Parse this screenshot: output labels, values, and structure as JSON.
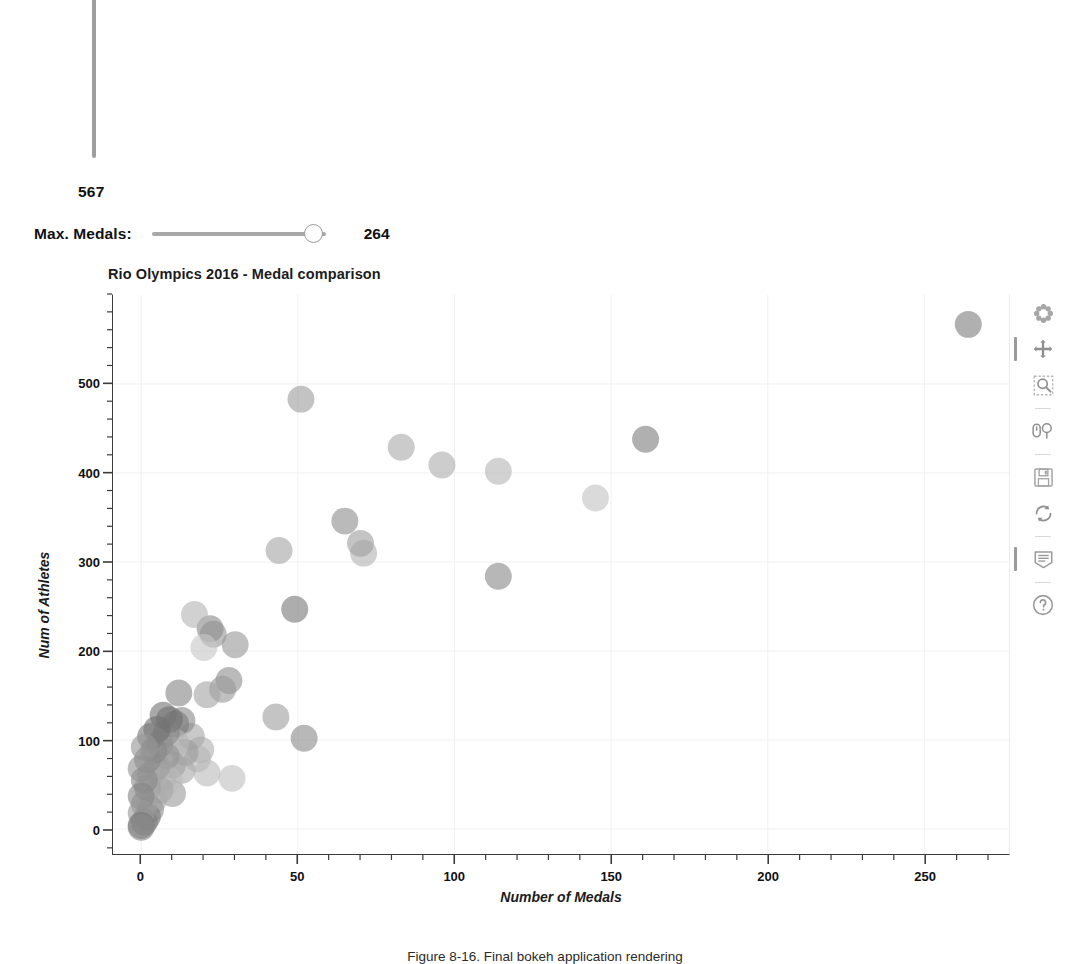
{
  "widgets": {
    "vertical_slider": {
      "name": "max-athletes-slider",
      "value": "567",
      "orientation": "vertical"
    },
    "max_medals_slider": {
      "label": "Max. Medals:",
      "value": "264",
      "min": 0,
      "max": 264,
      "current": 264
    }
  },
  "plot": {
    "title": "Rio Olympics 2016 - Medal comparison",
    "xlabel": "Number of Medals",
    "ylabel": "Num of Athletes"
  },
  "toolbar": {
    "tools": [
      {
        "name": "bokeh-logo-icon",
        "label": "Bokeh",
        "active": false,
        "sep_after": false
      },
      {
        "name": "pan-tool-icon",
        "label": "Pan",
        "active": true,
        "sep_after": false
      },
      {
        "name": "box-zoom-tool-icon",
        "label": "Box Zoom",
        "active": false,
        "sep_after": true
      },
      {
        "name": "wheel-zoom-tool-icon",
        "label": "Wheel Zoom",
        "active": false,
        "sep_after": true
      },
      {
        "name": "save-tool-icon",
        "label": "Save",
        "active": false,
        "sep_after": false
      },
      {
        "name": "reset-tool-icon",
        "label": "Reset",
        "active": false,
        "sep_after": true
      },
      {
        "name": "hover-tool-icon",
        "label": "Hover",
        "active": true,
        "sep_after": true
      },
      {
        "name": "help-tool-icon",
        "label": "Help",
        "active": false,
        "sep_after": false
      }
    ]
  },
  "caption": {
    "text": "Figure 8-16. Final bokeh application rendering"
  },
  "chart_data": {
    "type": "scatter",
    "title": "Rio Olympics 2016 - Medal comparison",
    "xlabel": "Number of Medals",
    "ylabel": "Num of Athletes",
    "xlim": [
      -9,
      277
    ],
    "ylim": [
      -28,
      600
    ],
    "xticks": [
      0,
      50,
      100,
      150,
      200,
      250
    ],
    "yticks": [
      0,
      100,
      200,
      300,
      400,
      500
    ],
    "x_minor_tick_step": 10,
    "y_minor_tick_step": 20,
    "grid": true,
    "grid_color": "#f0f0f0",
    "legend": null,
    "marker": "circle",
    "marker_size_px": 27,
    "marker_opacity": 0.62,
    "palette_note": "desaturated grayscale print rendering of a categorical palette",
    "points": [
      {
        "x": 264,
        "y": 567,
        "color": "#7f7f7f"
      },
      {
        "x": 161,
        "y": 438,
        "color": "#808080"
      },
      {
        "x": 145,
        "y": 372,
        "color": "#c4c4c4"
      },
      {
        "x": 114,
        "y": 402,
        "color": "#b6b6b6"
      },
      {
        "x": 114,
        "y": 284,
        "color": "#8a8a8a"
      },
      {
        "x": 96,
        "y": 409,
        "color": "#aeaeae"
      },
      {
        "x": 83,
        "y": 429,
        "color": "#ababab"
      },
      {
        "x": 71,
        "y": 310,
        "color": "#b3b3b3"
      },
      {
        "x": 70,
        "y": 321,
        "color": "#a0a0a0"
      },
      {
        "x": 65,
        "y": 346,
        "color": "#909090"
      },
      {
        "x": 51,
        "y": 483,
        "color": "#9e9e9e"
      },
      {
        "x": 52,
        "y": 102,
        "color": "#8c8c8c"
      },
      {
        "x": 49,
        "y": 247,
        "color": "#7b7b7b"
      },
      {
        "x": 44,
        "y": 313,
        "color": "#a6a6a6"
      },
      {
        "x": 43,
        "y": 126,
        "color": "#9f9f9f"
      },
      {
        "x": 30,
        "y": 207,
        "color": "#9a9a9a"
      },
      {
        "x": 29,
        "y": 57,
        "color": "#c0c0c0"
      },
      {
        "x": 28,
        "y": 167,
        "color": "#8f8f8f"
      },
      {
        "x": 26,
        "y": 157,
        "color": "#999999"
      },
      {
        "x": 23,
        "y": 219,
        "color": "#979797"
      },
      {
        "x": 22,
        "y": 225,
        "color": "#8d8d8d"
      },
      {
        "x": 21,
        "y": 151,
        "color": "#a4a4a4"
      },
      {
        "x": 21,
        "y": 63,
        "color": "#bcbcbc"
      },
      {
        "x": 20,
        "y": 204,
        "color": "#c6c6c6"
      },
      {
        "x": 19,
        "y": 89,
        "color": "#b0b0b0"
      },
      {
        "x": 18,
        "y": 79,
        "color": "#b8b8b8"
      },
      {
        "x": 17,
        "y": 241,
        "color": "#b5b5b5"
      },
      {
        "x": 16,
        "y": 104,
        "color": "#a8a8a8"
      },
      {
        "x": 14,
        "y": 86,
        "color": "#9c9c9c"
      },
      {
        "x": 13,
        "y": 122,
        "color": "#8b8b8b"
      },
      {
        "x": 13,
        "y": 66,
        "color": "#aaaaaa"
      },
      {
        "x": 12,
        "y": 153,
        "color": "#888888"
      },
      {
        "x": 11,
        "y": 118,
        "color": "#7d7d7d"
      },
      {
        "x": 11,
        "y": 97,
        "color": "#b4b4b4"
      },
      {
        "x": 10,
        "y": 72,
        "color": "#a2a2a2"
      },
      {
        "x": 10,
        "y": 40,
        "color": "#9d9d9d"
      },
      {
        "x": 9,
        "y": 123,
        "color": "#6f6f6f"
      },
      {
        "x": 9,
        "y": 54,
        "color": "#bdbdbd"
      },
      {
        "x": 8,
        "y": 108,
        "color": "#828282"
      },
      {
        "x": 8,
        "y": 82,
        "color": "#949494"
      },
      {
        "x": 7,
        "y": 128,
        "color": "#757575"
      },
      {
        "x": 7,
        "y": 58,
        "color": "#b2b2b2"
      },
      {
        "x": 6,
        "y": 96,
        "color": "#8e8e8e"
      },
      {
        "x": 6,
        "y": 44,
        "color": "#a7a7a7"
      },
      {
        "x": 5,
        "y": 112,
        "color": "#707070"
      },
      {
        "x": 5,
        "y": 70,
        "color": "#9b9b9b"
      },
      {
        "x": 4,
        "y": 88,
        "color": "#868686"
      },
      {
        "x": 4,
        "y": 33,
        "color": "#adadad"
      },
      {
        "x": 3,
        "y": 104,
        "color": "#7a7a7a"
      },
      {
        "x": 3,
        "y": 61,
        "color": "#a5a5a5"
      },
      {
        "x": 3,
        "y": 22,
        "color": "#929292"
      },
      {
        "x": 2,
        "y": 78,
        "color": "#898989"
      },
      {
        "x": 2,
        "y": 46,
        "color": "#9f9f9f"
      },
      {
        "x": 2,
        "y": 14,
        "color": "#7c7c7c"
      },
      {
        "x": 1,
        "y": 92,
        "color": "#969696"
      },
      {
        "x": 1,
        "y": 55,
        "color": "#8a8a8a"
      },
      {
        "x": 1,
        "y": 28,
        "color": "#a3a3a3"
      },
      {
        "x": 1,
        "y": 8,
        "color": "#7e7e7e"
      },
      {
        "x": 0,
        "y": 68,
        "color": "#919191"
      },
      {
        "x": 0,
        "y": 37,
        "color": "#858585"
      },
      {
        "x": 0,
        "y": 18,
        "color": "#9a9a9a"
      },
      {
        "x": 0,
        "y": 4,
        "color": "#767676"
      },
      {
        "x": 0,
        "y": 2,
        "color": "#8b8b8b"
      }
    ]
  }
}
